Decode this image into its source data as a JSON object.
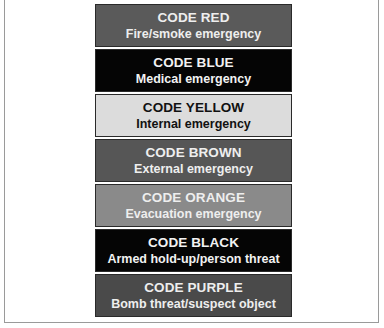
{
  "codes": [
    {
      "title": "CODE RED",
      "description": "Fire/smoke emergency",
      "bg": "#5a5a5a",
      "fg": "#eeeeee"
    },
    {
      "title": "CODE BLUE",
      "description": "Medical emergency",
      "bg": "#050505",
      "fg": "#f2f2f2"
    },
    {
      "title": "CODE YELLOW",
      "description": "Internal emergency",
      "bg": "#dcdcdc",
      "fg": "#111111"
    },
    {
      "title": "CODE BROWN",
      "description": "External emergency",
      "bg": "#565656",
      "fg": "#eeeeee"
    },
    {
      "title": "CODE ORANGE",
      "description": "Evacuation emergency",
      "bg": "#8a8a8a",
      "fg": "#eeeeee"
    },
    {
      "title": "CODE BLACK",
      "description": "Armed hold-up/person threat",
      "bg": "#050505",
      "fg": "#f2f2f2"
    },
    {
      "title": "CODE PURPLE",
      "description": "Bomb threat/suspect object",
      "bg": "#4a4a4a",
      "fg": "#eeeeee"
    }
  ]
}
